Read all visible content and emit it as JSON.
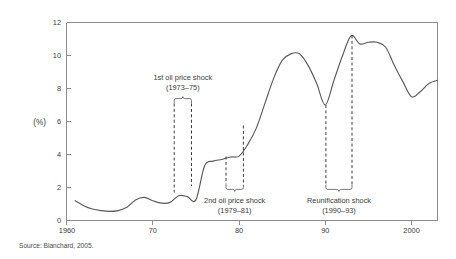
{
  "chart_data": {
    "type": "line",
    "title": "",
    "subtitle": "",
    "xlabel": "",
    "ylabel": "(%)",
    "ylim": [
      0,
      12
    ],
    "xlim": [
      1960,
      2003
    ],
    "yticks": [
      "0",
      "2",
      "4",
      "6",
      "8",
      "10",
      "12"
    ],
    "ytick_values": [
      0,
      2,
      4,
      6,
      8,
      10,
      12
    ],
    "xticks": [
      "1960",
      "70",
      "80",
      "90",
      "2000"
    ],
    "xtick_values": [
      1960,
      1970,
      1980,
      1990,
      2000
    ],
    "grid": false,
    "legend": "none",
    "series": [
      {
        "name": "Unemployment rate",
        "x": [
          1961,
          1962,
          1963,
          1964,
          1965,
          1966,
          1967,
          1968,
          1969,
          1970,
          1971,
          1972,
          1973,
          1974,
          1975,
          1976,
          1977,
          1978,
          1979,
          1980,
          1981,
          1982,
          1983,
          1984,
          1985,
          1986,
          1987,
          1988,
          1989,
          1990,
          1991,
          1992,
          1993,
          1994,
          1995,
          1996,
          1997,
          1998,
          1999,
          2000,
          2001,
          2002,
          2003
        ],
        "values": [
          1.2,
          0.9,
          0.7,
          0.6,
          0.55,
          0.6,
          0.8,
          1.25,
          1.4,
          1.2,
          1.05,
          1.1,
          1.5,
          1.45,
          1.25,
          3.3,
          3.6,
          3.7,
          3.85,
          3.9,
          4.6,
          5.6,
          7.1,
          8.6,
          9.7,
          10.1,
          10.1,
          9.4,
          8.3,
          7.0,
          8.5,
          10.0,
          11.2,
          10.7,
          10.8,
          10.8,
          10.5,
          9.4,
          8.4,
          7.5,
          7.8,
          8.3,
          8.5
        ]
      }
    ],
    "annotations": [
      {
        "label_line1": "1st oil price shock",
        "label_line2": "(1973–75)",
        "span_start": 1973,
        "span_end": 1975,
        "position": "above"
      },
      {
        "label_line1": "2nd oil price shock",
        "label_line2": "(1979–81)",
        "span_start": 1979,
        "span_end": 1981,
        "position": "below"
      },
      {
        "label_line1": "Reunification shock",
        "label_line2": "(1990–93)",
        "span_start": 1990,
        "span_end": 1993,
        "position": "below"
      }
    ],
    "colors": {
      "line": "#5a5a5a",
      "axis": "#8c8c8c",
      "annotation": "#3d3d3d",
      "background": "#ffffff"
    }
  },
  "source": {
    "note": "Source: Blanchard, 2005."
  },
  "axis": {
    "y_unit_label": "(%)",
    "y_labels": [
      "12",
      "10",
      "8",
      "6",
      "4",
      "2",
      "0"
    ],
    "x_labels": [
      "1960",
      "70",
      "80",
      "90",
      "2000"
    ]
  },
  "annotations": {
    "shock1": {
      "line1": "1st oil price shock",
      "line2": "(1973–75)"
    },
    "shock2": {
      "line1": "2nd oil price shock",
      "line2": "(1979–81)"
    },
    "shock3": {
      "line1": "Reunification shock",
      "line2": "(1990–93)"
    }
  }
}
